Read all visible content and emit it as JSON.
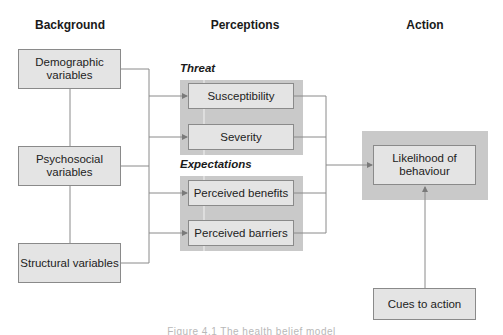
{
  "headers": {
    "background": "Background",
    "perceptions": "Perceptions",
    "action": "Action"
  },
  "background": {
    "items": [
      {
        "label": "Demographic variables"
      },
      {
        "label": "Psychosocial variables"
      },
      {
        "label": "Structural variables"
      }
    ]
  },
  "perceptions": {
    "threat": {
      "label": "Threat",
      "items": [
        {
          "label": "Susceptibility"
        },
        {
          "label": "Severity"
        }
      ]
    },
    "expectations": {
      "label": "Expectations",
      "items": [
        {
          "label": "Perceived benefits"
        },
        {
          "label": "Perceived barriers"
        }
      ]
    }
  },
  "action": {
    "outcome": {
      "label": "Likelihood of behaviour"
    },
    "cues": {
      "label": "Cues to action"
    }
  },
  "caption": "Figure 4.1 The health belief model",
  "colors": {
    "box_fill": "#e4e4e4",
    "group_fill": "#c9c9c9",
    "line": "#8a8a8a"
  }
}
